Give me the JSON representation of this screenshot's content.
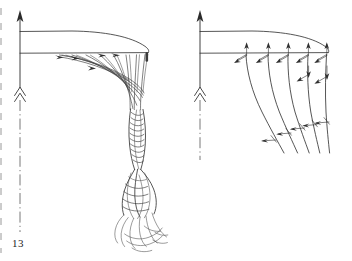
{
  "page": {
    "folio": "13",
    "background_color": "#ffffff",
    "ink_color": "#2b2b2b",
    "kind": "book-plate-line-drawing"
  },
  "figure": {
    "caption": "",
    "panels": [
      {
        "id": "left",
        "name": "rolled-up-vortex-rope",
        "description": "Trailing vortex sheet shed from a wing planform, rolling up into a twisted rope that frays at the lower end",
        "elements": {
          "axis_label": "",
          "wing_planform": "half-span lens / airfoil planform outline",
          "shed_sheet": "fan of shed vorticity filaments with arrowheads",
          "rope": "twisted multi-strand braid",
          "frayed_end": "unraveling strand ends"
        }
      },
      {
        "id": "right",
        "name": "vortex-sheet-with-velocity-vectors",
        "description": "Same planform with discrete trailing vortex filaments, each annotated by paired induced-velocity arrows",
        "elements": {
          "axis_label": "",
          "wing_planform": "half-span lens / airfoil planform outline",
          "filaments": "five curved trailing vortex lines",
          "upper_vector_pairs": 5,
          "lower_vector_pairs": 5
        }
      }
    ],
    "axis": {
      "name": "symmetry-axis",
      "style": "dash-dot",
      "tip_marker": "solid-arrowhead-up",
      "mid_marker": "double-chevron-up",
      "label": ""
    }
  }
}
